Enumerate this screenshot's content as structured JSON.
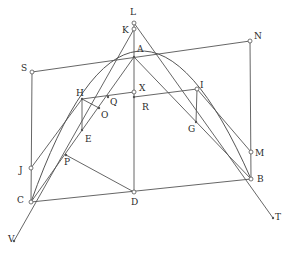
{
  "diagram": {
    "stroke_color": "#555555",
    "points": {
      "L": {
        "x": 134,
        "y": 23,
        "label": "L",
        "lx": 130,
        "ly": 8
      },
      "K": {
        "x": 134,
        "y": 29,
        "label": "K",
        "lx": 122,
        "ly": 26
      },
      "A": {
        "x": 134,
        "y": 57,
        "label": "A",
        "lx": 137,
        "ly": 45
      },
      "S": {
        "x": 32,
        "y": 72,
        "label": "S",
        "lx": 21,
        "ly": 64
      },
      "N": {
        "x": 250,
        "y": 41,
        "label": "N",
        "lx": 254,
        "ly": 32
      },
      "H": {
        "x": 82,
        "y": 99,
        "label": "H",
        "lx": 76,
        "ly": 89
      },
      "X": {
        "x": 134,
        "y": 92,
        "label": "X",
        "lx": 139,
        "ly": 84
      },
      "R": {
        "x": 134,
        "y": 97,
        "label": "R",
        "lx": 142,
        "ly": 103
      },
      "Q": {
        "x": 108,
        "y": 97,
        "label": "Q",
        "lx": 110,
        "ly": 98
      },
      "O": {
        "x": 99,
        "y": 108,
        "label": "O",
        "lx": 101,
        "ly": 111
      },
      "I": {
        "x": 197,
        "y": 89,
        "label": "I",
        "lx": 200,
        "ly": 81
      },
      "E": {
        "x": 82,
        "y": 130,
        "label": "E",
        "lx": 85,
        "ly": 135
      },
      "G": {
        "x": 196,
        "y": 122,
        "label": "G",
        "lx": 188,
        "ly": 125
      },
      "J": {
        "x": 31,
        "y": 168,
        "label": "J",
        "lx": 19,
        "ly": 166
      },
      "P": {
        "x": 66,
        "y": 155,
        "label": "P",
        "lx": 64,
        "ly": 158
      },
      "C": {
        "x": 31,
        "y": 202,
        "label": "C",
        "lx": 17,
        "ly": 196
      },
      "D": {
        "x": 134,
        "y": 192,
        "label": "D",
        "lx": 131,
        "ly": 198
      },
      "M": {
        "x": 251,
        "y": 152,
        "label": "M",
        "lx": 255,
        "ly": 149
      },
      "B": {
        "x": 251,
        "y": 179,
        "label": "B",
        "lx": 257,
        "ly": 175
      },
      "T": {
        "x": 273,
        "y": 218,
        "label": "T",
        "lx": 275,
        "ly": 213
      },
      "V": {
        "x": 14,
        "y": 241,
        "label": "V",
        "lx": 8,
        "ly": 235
      }
    },
    "segments": [
      [
        "S",
        "N"
      ],
      [
        "S",
        "C"
      ],
      [
        "N",
        "B"
      ],
      [
        "C",
        "B"
      ],
      [
        "L",
        "D"
      ],
      [
        "K",
        "V"
      ],
      [
        "L",
        "T"
      ],
      [
        "C",
        "A"
      ],
      [
        "A",
        "B"
      ],
      [
        "H",
        "J"
      ],
      [
        "H",
        "E"
      ],
      [
        "H",
        "O"
      ],
      [
        "H",
        "X"
      ],
      [
        "I",
        "R"
      ],
      [
        "I",
        "G"
      ],
      [
        "I",
        "M"
      ],
      [
        "P",
        "D"
      ]
    ],
    "curve": "M31,202 Q134,-88 251,179",
    "hollow_points": [
      "L",
      "K",
      "S",
      "N",
      "X",
      "I",
      "J",
      "C",
      "D",
      "M",
      "B"
    ],
    "dot_points": [
      "A",
      "H",
      "Q",
      "O",
      "E",
      "G",
      "P",
      "R",
      "T",
      "V"
    ]
  }
}
